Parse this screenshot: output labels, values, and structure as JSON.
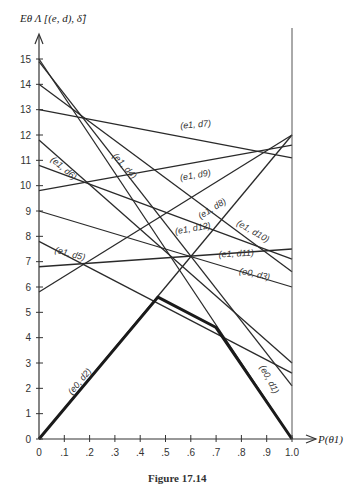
{
  "chart_data": {
    "type": "line",
    "title": "",
    "caption": "Figure 17.14",
    "xlabel": "P(θ1)",
    "ylabel": "Eθ Λ [(e, d), δ̂]",
    "xlim": [
      0,
      1.0
    ],
    "ylim": [
      0,
      15
    ],
    "x_ticks": [
      "0",
      ".1",
      ".2",
      ".3",
      ".4",
      ".5",
      ".6",
      ".7",
      ".8",
      ".9",
      "1.0"
    ],
    "y_ticks": [
      "0",
      "1",
      "2",
      "3",
      "4",
      "5",
      "6",
      "7",
      "8",
      "9",
      "10",
      "11",
      "12",
      "13",
      "14",
      "15"
    ],
    "grid": false,
    "legend": "inline labels",
    "series": [
      {
        "name": "(e1, d7)",
        "x": [
          0,
          1
        ],
        "values": [
          13.0,
          11.1
        ]
      },
      {
        "name": "(e1, d9)",
        "x": [
          0,
          1
        ],
        "values": [
          9.8,
          11.6
        ]
      },
      {
        "name": "(e1, d8)",
        "x": [
          0,
          1
        ],
        "values": [
          5.8,
          12.0
        ]
      },
      {
        "name": "(e0, d2)",
        "x": [
          0,
          1
        ],
        "values": [
          0.0,
          12.0
        ]
      },
      {
        "name": "(e1, d11)",
        "x": [
          0,
          1
        ],
        "values": [
          6.8,
          7.5
        ]
      },
      {
        "name": "(e1, d12)",
        "x": [
          0,
          1
        ],
        "values": [
          10.8,
          7.1
        ]
      },
      {
        "name": "(e1, d10)",
        "x": [
          0,
          1
        ],
        "values": [
          14.0,
          6.6
        ]
      },
      {
        "name": "(e0, d3)",
        "x": [
          0,
          1
        ],
        "values": [
          9.0,
          6.0
        ]
      },
      {
        "name": "(e1, d6)",
        "x": [
          0,
          1
        ],
        "values": [
          11.8,
          3.0
        ]
      },
      {
        "name": "(e1, d5)",
        "x": [
          0,
          1
        ],
        "values": [
          7.8,
          2.6
        ]
      },
      {
        "name": "(e1, d4)",
        "x": [
          0,
          1
        ],
        "values": [
          14.9,
          2.1
        ]
      },
      {
        "name": "(e0, d1)",
        "x": [
          0,
          1
        ],
        "values": [
          15.0,
          0.0
        ]
      }
    ],
    "envelope": {
      "name": "minimum Bayes risk (thick)",
      "x": [
        0,
        0.47,
        0.7,
        1.0
      ],
      "values": [
        0.0,
        5.6,
        4.4,
        0.0
      ]
    }
  },
  "labels": [
    {
      "text": "(e1, d7)",
      "x": 0.62,
      "y": 12.3,
      "angle": -5
    },
    {
      "text": "(e1, d9)",
      "x": 0.62,
      "y": 10.3,
      "angle": -10
    },
    {
      "text": "(e1, d8)",
      "x": 0.69,
      "y": 9.0,
      "angle": -32
    },
    {
      "text": "(e1, d6)",
      "x": 0.09,
      "y": 10.6,
      "angle": 40
    },
    {
      "text": "(e1, d4)",
      "x": 0.33,
      "y": 10.7,
      "angle": 48
    },
    {
      "text": "(e1, d12)",
      "x": 0.61,
      "y": 8.2,
      "angle": -10
    },
    {
      "text": "(e1, d10)",
      "x": 0.84,
      "y": 8.1,
      "angle": 30
    },
    {
      "text": "(e1, d11)",
      "x": 0.78,
      "y": 7.2,
      "angle": -3
    },
    {
      "text": "(e0, d3)",
      "x": 0.85,
      "y": 6.4,
      "angle": 12
    },
    {
      "text": "(e1, d5)",
      "x": 0.12,
      "y": 7.2,
      "angle": 15
    },
    {
      "text": "(e0, d2)",
      "x": 0.17,
      "y": 2.2,
      "angle": -50
    },
    {
      "text": "(e0, d1)",
      "x": 0.9,
      "y": 2.3,
      "angle": 62
    }
  ]
}
